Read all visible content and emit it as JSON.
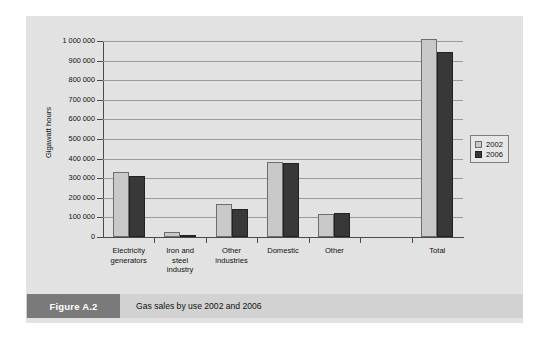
{
  "figure": {
    "tag": "Figure A.2",
    "caption": "Gas sales by use 2002 and 2006"
  },
  "colors": {
    "series_2002": "#c9c9c9",
    "series_2006": "#383838",
    "panel": "#e2e2e2",
    "caption_bar": "#d2d2d2",
    "caption_tag": "#7a7a7a",
    "gridline": "#9a9a9a",
    "axis": "#4a4a4a"
  },
  "chart_data": {
    "type": "bar",
    "title": "Gas sales by use 2002 and 2006",
    "xlabel": "",
    "ylabel": "Gigawatt hours",
    "ylim": [
      0,
      1000000
    ],
    "ytick_labels": [
      "1 000 000",
      "900 000",
      "800 000",
      "700 000",
      "600 000",
      "500 000",
      "400 000",
      "300 000",
      "200 000",
      "100 000",
      "0"
    ],
    "ytick_values": [
      1000000,
      900000,
      800000,
      700000,
      600000,
      500000,
      400000,
      300000,
      200000,
      100000,
      0
    ],
    "grid": true,
    "legend_position": "right",
    "categories": [
      "Electricity generators",
      "Iron and steel industry",
      "Other industries",
      "Domestic",
      "Other",
      "",
      "Total"
    ],
    "category_lines": [
      [
        "Electricity",
        "generators"
      ],
      [
        "Iron and",
        "steel",
        "industry"
      ],
      [
        "Other",
        "industries"
      ],
      [
        "Domestic"
      ],
      [
        "Other"
      ],
      [
        ""
      ],
      [
        "Total"
      ]
    ],
    "series": [
      {
        "name": "2002",
        "values": [
          330000,
          25000,
          170000,
          385000,
          118000,
          null,
          1010000
        ]
      },
      {
        "name": "2006",
        "values": [
          312000,
          12000,
          145000,
          378000,
          122000,
          null,
          945000
        ]
      }
    ]
  }
}
